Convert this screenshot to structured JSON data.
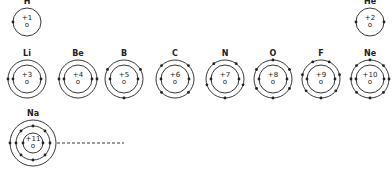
{
  "atoms": [
    {
      "symbol": "H",
      "charge": "+1",
      "nucleus_label": "o",
      "cx": 27,
      "cy": 22,
      "shells": [
        {
          "r": 14,
          "electrons": 1,
          "start": 180
        }
      ]
    },
    {
      "symbol": "He",
      "charge": "+2",
      "nucleus_label": "o",
      "cx": 370,
      "cy": 22,
      "shells": [
        {
          "r": 14,
          "electrons": 2,
          "start": 180
        }
      ]
    },
    {
      "symbol": "Li",
      "charge": "+3",
      "nucleus_label": "o",
      "cx": 27,
      "cy": 79,
      "shells": [
        {
          "r": 14,
          "electrons": 2,
          "start": 180
        },
        {
          "r": 19,
          "electrons": 1,
          "start": 180
        }
      ]
    },
    {
      "symbol": "Be",
      "charge": "+4",
      "nucleus_label": "o",
      "cx": 78,
      "cy": 79,
      "shells": [
        {
          "r": 14,
          "electrons": 2,
          "start": 180
        },
        {
          "r": 19,
          "electrons": 2,
          "start": 180
        }
      ]
    },
    {
      "symbol": "B",
      "charge": "+5",
      "nucleus_label": "o",
      "cx": 124,
      "cy": 79,
      "shells": [
        {
          "r": 14,
          "electrons": 2,
          "start": 180
        },
        {
          "r": 19,
          "electrons": 3,
          "start": 270
        }
      ]
    },
    {
      "symbol": "C",
      "charge": "+6",
      "nucleus_label": "o",
      "cx": 175,
      "cy": 79,
      "shells": [
        {
          "r": 14,
          "electrons": 2,
          "start": 180
        },
        {
          "r": 19,
          "electrons": 4,
          "start": 225
        }
      ]
    },
    {
      "symbol": "N",
      "charge": "+7",
      "nucleus_label": "o",
      "cx": 225,
      "cy": 79,
      "shells": [
        {
          "r": 14,
          "electrons": 2,
          "start": 180
        },
        {
          "r": 19,
          "electrons": 5,
          "start": 270
        }
      ]
    },
    {
      "symbol": "O",
      "charge": "+8",
      "nucleus_label": "o",
      "cx": 273,
      "cy": 79,
      "shells": [
        {
          "r": 14,
          "electrons": 2,
          "start": 180
        },
        {
          "r": 19,
          "electrons": 6,
          "start": 270
        }
      ]
    },
    {
      "symbol": "F",
      "charge": "+9",
      "nucleus_label": "o",
      "cx": 321,
      "cy": 79,
      "shells": [
        {
          "r": 14,
          "electrons": 2,
          "start": 180
        },
        {
          "r": 19,
          "electrons": 7,
          "start": 270
        }
      ]
    },
    {
      "symbol": "Ne",
      "charge": "+10",
      "nucleus_label": "o",
      "cx": 370,
      "cy": 79,
      "shells": [
        {
          "r": 14,
          "electrons": 2,
          "start": 180
        },
        {
          "r": 19,
          "electrons": 8,
          "start": 270
        }
      ]
    },
    {
      "symbol": "Na",
      "charge": "+11",
      "nucleus_label": "o",
      "cx": 33,
      "cy": 143,
      "shells": [
        {
          "r": 10,
          "electrons": 2,
          "start": 180
        },
        {
          "r": 17,
          "electrons": 8,
          "start": 270
        },
        {
          "r": 23,
          "electrons": 1,
          "start": 180
        }
      ]
    }
  ],
  "continuation": {
    "x1": 57,
    "x2": 124,
    "y": 143,
    "style": "dashed"
  },
  "colors": {
    "line": "#222222",
    "background": "#ffffff"
  }
}
